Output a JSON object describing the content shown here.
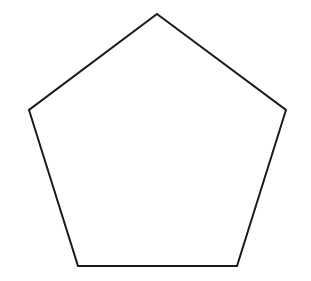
{
  "diagram": {
    "shape": "pentagon",
    "stroke_color": "#1a1a1a",
    "fill_color": "#ffffff",
    "stroke_width": 2,
    "vertices": [
      [
        157,
        14
      ],
      [
        286,
        110
      ],
      [
        237,
        266
      ],
      [
        78,
        266
      ],
      [
        29,
        110
      ]
    ],
    "points": "157,14 286,110 237,266 78,266 29,110"
  }
}
